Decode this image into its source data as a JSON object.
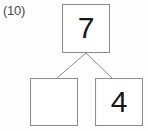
{
  "worksheet": {
    "problem_number": "(10)",
    "type": "number-bond",
    "colors": {
      "box_border": "#8d8d8d",
      "connector_line": "#8d8d8d",
      "digit": "#171717",
      "label": "#4a4a4a",
      "background": "#fdfdfd"
    },
    "number_bond": {
      "whole": {
        "label": "7",
        "filled": true
      },
      "parts": [
        {
          "label": "",
          "filled": false
        },
        {
          "label": "4",
          "filled": true
        }
      ]
    },
    "connectors": [
      {
        "x1": 86,
        "y1": 53,
        "x2": 57,
        "y2": 78
      },
      {
        "x1": 86,
        "y1": 53,
        "x2": 112,
        "y2": 78
      }
    ]
  }
}
